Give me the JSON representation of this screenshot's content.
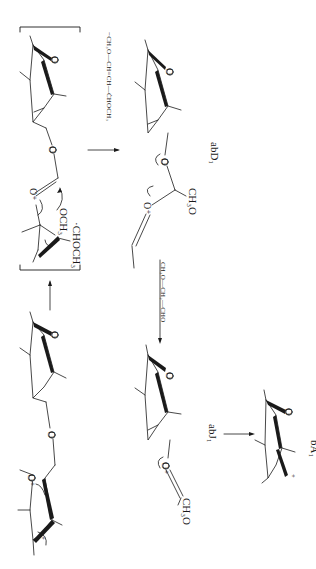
{
  "figure": {
    "orientation": "rotated-90-clockwise",
    "background": "#ffffff",
    "ink": "#1a1a1a"
  },
  "reagents": {
    "top_elimination": "−CH₃O—CH=CH—ĊHOCH₃",
    "middle_elimination": "CH₃O—CH₂—CHO"
  },
  "intermediate": {
    "substituent_methoxy": "OCH₃",
    "substituent_radical": "·CHOCH₃",
    "oxonium": "O⁺"
  },
  "products": {
    "abD1": "abD₁",
    "abJ1": "abJ₁",
    "bA1": "bA₁"
  },
  "fragments": {
    "ch3o_upper": "CH₃O",
    "ch3o_lower": "CH₃O",
    "oxonium_upper": "O⁺",
    "oxonium_lower": "O⁺",
    "start_oxonium": "O⁺"
  },
  "atoms": {
    "ring_oxygen": "O",
    "bridge_oxygen": "O",
    "charge_plus": "+"
  }
}
